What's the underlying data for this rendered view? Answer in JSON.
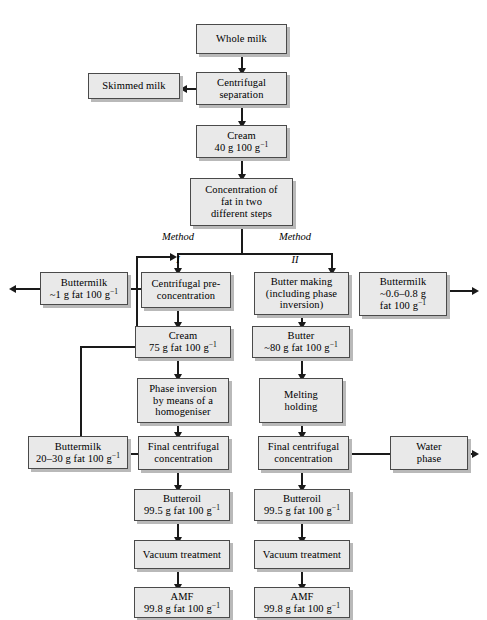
{
  "diagram": {
    "type": "process-flow-diagram",
    "colors": {
      "box_fill": "#e9e9e9",
      "box_border": "#4a4a4a",
      "box_shadow": "#b9b9b9",
      "connector": "#1a1a1a",
      "background": "#ffffff"
    },
    "method_labels": [
      {
        "id": "method-1",
        "line1": "Method",
        "line2": "I"
      },
      {
        "id": "method-2",
        "line1": "Method",
        "line2": "II"
      }
    ],
    "nodes": [
      {
        "id": "whole-milk",
        "lines": [
          "Whole milk"
        ]
      },
      {
        "id": "centrifugal-separation",
        "lines": [
          "Centrifugal",
          "separation"
        ]
      },
      {
        "id": "skimmed-milk",
        "lines": [
          "Skimmed milk"
        ]
      },
      {
        "id": "cream-40",
        "lines": [
          "Cream",
          "40 g 100 g⁻¹"
        ]
      },
      {
        "id": "concentration-fat",
        "lines": [
          "Concentration of",
          "fat in two",
          "different steps"
        ]
      },
      {
        "id": "buttermilk-1",
        "lines": [
          "Buttermilk",
          "~1 g fat 100 g⁻¹"
        ]
      },
      {
        "id": "centrifugal-pre",
        "lines": [
          "Centrifugal pre-",
          "concentration"
        ]
      },
      {
        "id": "butter-making",
        "lines": [
          "Butter making",
          "(including phase",
          "inversion)"
        ]
      },
      {
        "id": "buttermilk-06-08",
        "lines": [
          "Buttermilk",
          "~0.6–0.8 g",
          "fat 100 g⁻¹"
        ]
      },
      {
        "id": "cream-75",
        "lines": [
          "Cream",
          "75 g fat 100 g⁻¹"
        ]
      },
      {
        "id": "butter-80",
        "lines": [
          "Butter",
          "~80 g fat 100 g⁻¹"
        ]
      },
      {
        "id": "phase-inversion",
        "lines": [
          "Phase inversion",
          "by means of a",
          "homogeniser"
        ]
      },
      {
        "id": "melting-holding",
        "lines": [
          "Melting",
          "holding"
        ]
      },
      {
        "id": "buttermilk-20-30",
        "lines": [
          "Buttermilk",
          "20–30 g fat 100 g⁻¹"
        ]
      },
      {
        "id": "final-centrifugal-1",
        "lines": [
          "Final centrifugal",
          "concentration"
        ]
      },
      {
        "id": "final-centrifugal-2",
        "lines": [
          "Final centrifugal",
          "concentration"
        ]
      },
      {
        "id": "water-phase",
        "lines": [
          "Water",
          "phase"
        ]
      },
      {
        "id": "butteroil-1",
        "lines": [
          "Butteroil",
          "99.5 g fat 100 g⁻¹"
        ]
      },
      {
        "id": "butteroil-2",
        "lines": [
          "Butteroil",
          "99.5 g fat 100 g⁻¹"
        ]
      },
      {
        "id": "vacuum-1",
        "lines": [
          "Vacuum treatment"
        ]
      },
      {
        "id": "vacuum-2",
        "lines": [
          "Vacuum treatment"
        ]
      },
      {
        "id": "amf-1",
        "lines": [
          "AMF",
          "99.8 g fat 100 g⁻¹"
        ]
      },
      {
        "id": "amf-2",
        "lines": [
          "AMF",
          "99.8 g fat 100 g⁻¹"
        ]
      }
    ]
  }
}
